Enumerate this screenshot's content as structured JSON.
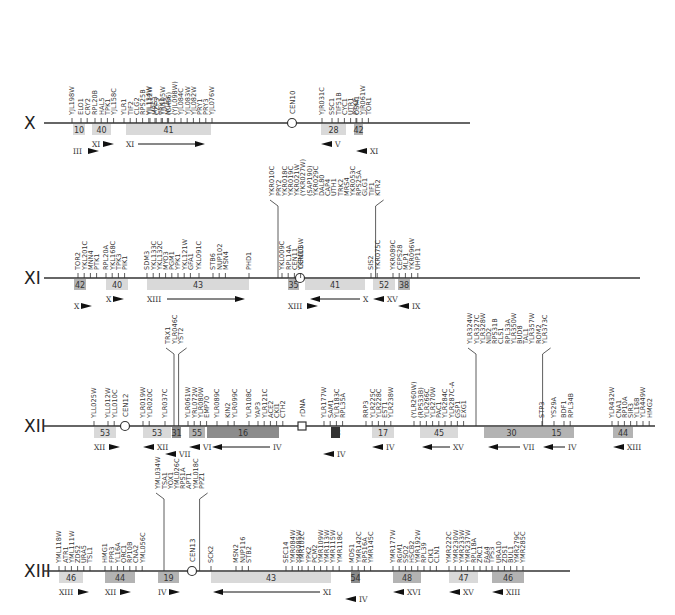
{
  "figure": {
    "type": "chromosome synteny map",
    "colors": {
      "axis": "#333333",
      "block_light": "#d9d9d9",
      "block_mid": "#b3b3b3",
      "block_dark": "#8c8c8c",
      "block_black": "#333333"
    }
  },
  "chromosomes": [
    {
      "name": "X",
      "y": 123,
      "x0": 44,
      "x1": 470,
      "centromere": {
        "label": "CEN10",
        "x": 292
      },
      "blocks": [
        {
          "num": "10",
          "x": 73,
          "w": 12,
          "shade": "light",
          "arrows": [
            {
              "dir": "right",
              "label": "III",
              "x": 73,
              "row": 2
            }
          ]
        },
        {
          "num": "40",
          "x": 92,
          "w": 19,
          "shade": "light",
          "arrows": [
            {
              "dir": "right",
              "label": "XI",
              "x": 92,
              "row": 1
            }
          ]
        },
        {
          "num": "41",
          "x": 126,
          "w": 85,
          "shade": "light",
          "arrows": [
            {
              "dir": "right-long",
              "label": "XI",
              "x": 126,
              "x2": 205,
              "row": 1
            }
          ]
        },
        {
          "num": "28",
          "x": 321,
          "w": 25,
          "shade": "light",
          "arrows": [
            {
              "dir": "left",
              "label": "V",
              "x": 321,
              "row": 1
            }
          ]
        },
        {
          "num": "42",
          "x": 354,
          "w": 9,
          "shade": "mid",
          "arrows": [
            {
              "dir": "left",
              "label": "XI",
              "x": 356,
              "row": 2
            }
          ]
        }
      ],
      "gene_groups": [
        {
          "x": 72,
          "top": true,
          "genes": [
            "YJL198W"
          ]
        },
        {
          "x": 81,
          "top": true,
          "genes": [
            "ELO1",
            "CRY2"
          ]
        },
        {
          "x": 95,
          "top": false,
          "genes": [
            "RPL20B",
            "HAL5",
            "TPK1",
            "YJL158C"
          ]
        },
        {
          "x": 124,
          "top": true,
          "genes": [
            "YLR1",
            "TIF2",
            "CLG2",
            "RPS25B",
            "YJL134W",
            "MRS3",
            "TRK1",
            "NCA3"
          ]
        },
        {
          "x": 150,
          "top": true,
          "genes": [
            "YJL112W",
            "CZF3",
            "YJL105W",
            "(CH56)",
            "(YJL098W)",
            "YJL084C",
            "YJL083W",
            "YJL082W",
            "PRY1",
            "PRY3",
            "YJL076W"
          ]
        },
        {
          "x": 322,
          "top": true,
          "genes": [
            "YJR031C"
          ]
        },
        {
          "x": 332,
          "top": true,
          "genes": [
            "SSC1",
            "TIF51B",
            "CYC1",
            "UTR1",
            "OSM1"
          ]
        },
        {
          "x": 356,
          "top": false,
          "genes": [
            "PTK2",
            "YJR061W",
            "TOR1"
          ]
        }
      ]
    },
    {
      "name": "XI",
      "y": 278,
      "x0": 44,
      "x1": 640,
      "centromere": {
        "label": "CEN11",
        "x": 300
      },
      "blocks": [
        {
          "num": "42",
          "x": 74,
          "w": 12,
          "shade": "mid",
          "arrows": [
            {
              "dir": "right",
              "label": "X",
              "x": 74,
              "row": 2
            }
          ]
        },
        {
          "num": "40",
          "x": 106,
          "w": 22,
          "shade": "light",
          "arrows": [
            {
              "dir": "right",
              "label": "X",
              "x": 106,
              "row": 1
            }
          ]
        },
        {
          "num": "43",
          "x": 147,
          "w": 102,
          "shade": "light",
          "arrows": [
            {
              "dir": "right-long",
              "label": "XIII",
              "x": 147,
              "x2": 245,
              "row": 1
            }
          ]
        },
        {
          "num": "35",
          "x": 288,
          "w": 11,
          "shade": "mid",
          "arrows": [
            {
              "dir": "right",
              "label": "XIII",
              "x": 288,
              "row": 2
            }
          ]
        },
        {
          "num": "41",
          "x": 305,
          "w": 60,
          "shade": "light",
          "arrows": [
            {
              "dir": "left-long",
              "label": "X",
              "x": 310,
              "x2": 360,
              "row": 1
            }
          ]
        },
        {
          "num": "52",
          "x": 373,
          "w": 22,
          "shade": "light",
          "arrows": [
            {
              "dir": "left",
              "label": "XV",
              "x": 373,
              "row": 1
            }
          ]
        },
        {
          "num": "38",
          "x": 398,
          "w": 12,
          "shade": "mid",
          "arrows": [
            {
              "dir": "left",
              "label": "IX",
              "x": 398,
              "row": 2
            }
          ]
        }
      ],
      "gene_groups": [
        {
          "x": 78,
          "top": true,
          "genes": [
            "TOR2",
            "YKL201C",
            "MNN4",
            "PTK1"
          ]
        },
        {
          "x": 106,
          "top": true,
          "genes": [
            "RPL20A",
            "YKL168C",
            "TPK3",
            "PIK1"
          ]
        },
        {
          "x": 147,
          "top": true,
          "genes": [
            "SDM3",
            "YKL133C",
            "YKL132C",
            "MYO3",
            "PGM1",
            "YPK1",
            "YKL121W",
            "GFA1"
          ]
        },
        {
          "x": 199,
          "top": true,
          "genes": [
            "YKL091C"
          ]
        },
        {
          "x": 213,
          "top": true,
          "genes": [
            "STB6",
            "NUP102",
            "MSN4"
          ]
        },
        {
          "x": 249,
          "top": true,
          "genes": [
            "PHD1"
          ]
        },
        {
          "x": 282,
          "top": true,
          "genes": [
            "YKL009C",
            "RPL14A",
            "CEN11",
            "YKR003W"
          ]
        },
        {
          "x": 272,
          "top": true,
          "high": true,
          "genes": [
            "YKR010C",
            "PRY2",
            "YKR018C",
            "YKR019C",
            "YKR021W",
            "(YKR027W)",
            "(SAP190)",
            "YKR029C",
            "DAL80",
            "CAP4",
            "UTH1",
            "TRK2",
            "MRS4",
            "YKR053C",
            "RPS25A",
            "GLG1",
            "TIF1",
            "KTR2"
          ]
        },
        {
          "x": 371,
          "top": true,
          "genes": [
            "SIS2",
            "YKR075C"
          ]
        },
        {
          "x": 393,
          "top": true,
          "genes": [
            "YKR089C",
            "CEPS28",
            "MLP1",
            "YKR096W",
            "UHP11"
          ]
        }
      ]
    },
    {
      "name": "XII",
      "y": 426,
      "x0": 44,
      "x1": 655,
      "centromere": {
        "label": "CEN12",
        "x": 125
      },
      "rdna": {
        "label": "rDNA",
        "x": 302
      },
      "blocks": [
        {
          "num": "53",
          "x": 94,
          "w": 22,
          "shade": "light",
          "arrows": [
            {
              "dir": "right",
              "label": "XII",
              "x": 94,
              "row": 1
            }
          ]
        },
        {
          "num": "53",
          "x": 143,
          "w": 28,
          "shade": "light",
          "arrows": [
            {
              "dir": "left",
              "label": "XII",
              "x": 143,
              "row": 1
            }
          ]
        },
        {
          "num": "31",
          "x": 172,
          "w": 9,
          "shade": "dark",
          "arrows": [
            {
              "dir": "left",
              "label": "VII",
              "x": 165,
              "row": 2
            }
          ]
        },
        {
          "num": "55",
          "x": 189,
          "w": 16,
          "shade": "mid",
          "arrows": [
            {
              "dir": "left",
              "label": "VI",
              "x": 189,
              "row": 1
            }
          ]
        },
        {
          "num": "16",
          "x": 207,
          "w": 72,
          "shade": "dark",
          "arrows": [
            {
              "dir": "left-long",
              "label": "IV",
              "x": 212,
              "x2": 270,
              "row": 1
            }
          ]
        },
        {
          "num": "18",
          "x": 331,
          "w": 9,
          "shade": "black",
          "arrows": [
            {
              "dir": "left",
              "label": "IV",
              "x": 323,
              "row": 2
            }
          ]
        },
        {
          "num": "17",
          "x": 372,
          "w": 22,
          "shade": "light",
          "arrows": [
            {
              "dir": "left",
              "label": "IV",
              "x": 372,
              "row": 1
            }
          ]
        },
        {
          "num": "45",
          "x": 420,
          "w": 38,
          "shade": "light",
          "arrows": [
            {
              "dir": "left-long",
              "label": "XV",
              "x": 422,
              "x2": 450,
              "row": 1
            }
          ]
        },
        {
          "num": "30",
          "x": 484,
          "w": 55,
          "shade": "mid",
          "arrows": [
            {
              "dir": "left-long",
              "label": "VII",
              "x": 488,
              "x2": 520,
              "row": 1
            }
          ]
        },
        {
          "num": "15",
          "x": 539,
          "w": 35,
          "shade": "mid",
          "arrows": [
            {
              "dir": "left-long",
              "label": "IV",
              "x": 543,
              "x2": 565,
              "row": 1
            }
          ]
        },
        {
          "num": "44",
          "x": 613,
          "w": 20,
          "shade": "mid",
          "arrows": [
            {
              "dir": "left",
              "label": "XIII",
              "x": 613,
              "row": 1
            }
          ]
        }
      ],
      "gene_groups": [
        {
          "x": 94,
          "top": true,
          "genes": [
            "YLL025W"
          ]
        },
        {
          "x": 108,
          "top": true,
          "genes": [
            "YLL012W",
            "YLL010C"
          ]
        },
        {
          "x": 143,
          "top": true,
          "genes": [
            "YLR019W",
            "YLR020C"
          ]
        },
        {
          "x": 165,
          "top": true,
          "genes": [
            "YLR037C"
          ]
        },
        {
          "x": 168,
          "top": true,
          "high": true,
          "genes": [
            "TRX1",
            "YLR046C",
            "YST2"
          ]
        },
        {
          "x": 188,
          "top": true,
          "genes": [
            "YLR061W",
            "YRL072W",
            "YLR080W",
            "EMP70"
          ]
        },
        {
          "x": 217,
          "top": true,
          "genes": [
            "YLR089C"
          ]
        },
        {
          "x": 228,
          "top": true,
          "genes": [
            "KIN2",
            "YLR099C"
          ]
        },
        {
          "x": 249,
          "top": true,
          "genes": [
            "YLR108C"
          ]
        },
        {
          "x": 258,
          "top": true,
          "genes": [
            "YAP3",
            "YLR121C",
            "ACE2",
            "CKI1",
            "CTH2"
          ]
        },
        {
          "x": 324,
          "top": true,
          "genes": [
            "YLR177W",
            "SAM1",
            "YLR183C",
            "RPL35A"
          ]
        },
        {
          "x": 366,
          "top": true,
          "genes": [
            "RRP3",
            "YLR225C",
            "YLR228C",
            "EST1",
            "YLR238W"
          ]
        },
        {
          "x": 414,
          "top": true,
          "genes": [
            "(YLR260W)",
            "(RPS33B)",
            "YLR266C",
            "YLR270W",
            "PAC1",
            "YLR284C",
            "YLR287C-A",
            "GSP1",
            "EXG1"
          ]
        },
        {
          "x": 470,
          "top": true,
          "high": true,
          "genes": [
            "YLR324W",
            "YLR327C",
            "YLR328W",
            "NID2",
            "RPS31B",
            "CLS1",
            "RPL33A",
            "YLR350W",
            "BUD8",
            "TAL1",
            "YLR357W",
            "ROM2",
            "YLR373C"
          ]
        },
        {
          "x": 542,
          "top": true,
          "genes": [
            "STP3"
          ]
        },
        {
          "x": 554,
          "top": true,
          "genes": [
            "YS29A"
          ]
        },
        {
          "x": 564,
          "top": true,
          "genes": [
            "BDF1",
            "RPL34B"
          ]
        },
        {
          "x": 612,
          "top": true,
          "genes": [
            "YLR432W",
            "CNA1",
            "RP10A",
            "SIR3",
            "YL16B",
            "YLR449W",
            "HMG2"
          ]
        }
      ]
    },
    {
      "name": "XIII",
      "y": 571,
      "x0": 44,
      "x1": 570,
      "centromere": {
        "label": "CEN13",
        "x": 192
      },
      "blocks": [
        {
          "num": "46",
          "x": 59,
          "w": 24,
          "shade": "light",
          "arrows": [
            {
              "dir": "right",
              "label": "XIII",
              "x": 59,
              "row": 1
            }
          ]
        },
        {
          "num": "44",
          "x": 105,
          "w": 30,
          "shade": "mid",
          "arrows": [
            {
              "dir": "right",
              "label": "XII",
              "x": 105,
              "row": 1
            }
          ]
        },
        {
          "num": "19",
          "x": 158,
          "w": 21,
          "shade": "mid",
          "arrows": [
            {
              "dir": "right",
              "label": "IV",
              "x": 158,
              "row": 1
            }
          ]
        },
        {
          "num": "43",
          "x": 211,
          "w": 120,
          "shade": "light",
          "arrows": [
            {
              "dir": "left-long",
              "label": "XI",
              "x": 213,
              "x2": 320,
              "row": 1
            }
          ]
        },
        {
          "num": "54",
          "x": 351,
          "w": 9,
          "shade": "dark",
          "arrows": [
            {
              "dir": "left",
              "label": "IV",
              "x": 345,
              "row": 2
            }
          ]
        },
        {
          "num": "48",
          "x": 393,
          "w": 28,
          "shade": "mid",
          "arrows": [
            {
              "dir": "left",
              "label": "XVI",
              "x": 393,
              "row": 1
            }
          ]
        },
        {
          "num": "47",
          "x": 449,
          "w": 29,
          "shade": "light",
          "arrows": [
            {
              "dir": "left",
              "label": "XV",
              "x": 449,
              "row": 1
            }
          ]
        },
        {
          "num": "46",
          "x": 492,
          "w": 32,
          "shade": "mid",
          "arrows": [
            {
              "dir": "left",
              "label": "XIII",
              "x": 492,
              "row": 1
            }
          ]
        }
      ],
      "gene_groups": [
        {
          "x": 59,
          "top": true,
          "genes": [
            "YML118W",
            "ATR1",
            "YML111W",
            "ZDS2",
            "URA5",
            "TSL1"
          ]
        },
        {
          "x": 105,
          "top": true,
          "genes": [
            "HMG1",
            "FPR3",
            "YL16A",
            "ORC1",
            "RP10B",
            "CNA2",
            "YML056C"
          ]
        },
        {
          "x": 158,
          "top": true,
          "high": true,
          "genes": [
            "YML034W",
            "TSA1",
            "YOX1",
            "YML026C",
            "RPS1A",
            "APT1",
            "YML018C",
            "PPZ1"
          ]
        },
        {
          "x": 211,
          "top": true,
          "genes": [
            "SCK2"
          ]
        },
        {
          "x": 236,
          "top": true,
          "genes": [
            "MSN2",
            "NUP116",
            "STB2"
          ]
        },
        {
          "x": 286,
          "top": true,
          "genes": [
            "SEC14",
            "YMR084W",
            "YMR085W"
          ]
        },
        {
          "x": 302,
          "top": true,
          "genes": [
            "YMR102C",
            "YPK2",
            "PCM2",
            "YMR109W",
            "YMR113W",
            "YMR115W",
            "YMR118C"
          ]
        },
        {
          "x": 352,
          "top": true,
          "genes": [
            "MDS1",
            "YMR142C",
            "RPS16A",
            "YMR145C"
          ]
        },
        {
          "x": 393,
          "top": true,
          "genes": [
            "YMR177W",
            "RGM1",
            "SSO2",
            "HSCB2",
            "YMR192W",
            "RPL39",
            "CIK1",
            "CLN1"
          ]
        },
        {
          "x": 449,
          "top": true,
          "genes": [
            "YMR222C",
            "YMR230W",
            "YMR233W",
            "YMR237W",
            "RPL18A",
            "ZRC1",
            "FAA4"
          ]
        },
        {
          "x": 492,
          "top": true,
          "genes": [
            "TPS3",
            "URA10",
            "ZDS1",
            "BUL1",
            "YMR279C",
            "YMR285C"
          ]
        }
      ]
    }
  ]
}
